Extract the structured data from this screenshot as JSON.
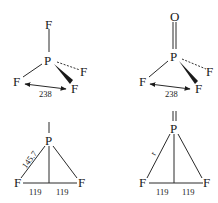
{
  "diagrams": [
    {
      "id": "pf3-3d",
      "atoms": {
        "central": "P",
        "top": "F",
        "dashed": "F",
        "left": "F",
        "wedge": "F"
      },
      "labels": {
        "ff_distance": "238"
      }
    },
    {
      "id": "opf3-3d",
      "atoms": {
        "central": "P",
        "top": "O",
        "dashed": "F",
        "left": "F",
        "wedge": "F"
      },
      "labels": {
        "ff_distance": "238"
      }
    },
    {
      "id": "pf3-projection",
      "atoms": {
        "central": "P",
        "left": "F",
        "right": "F"
      },
      "labels": {
        "pf_bond": "145.7",
        "half_left": "119",
        "half_right": "119"
      }
    },
    {
      "id": "opf3-projection",
      "atoms": {
        "central": "P",
        "left": "F",
        "right": "F"
      },
      "labels": {
        "pf_bond": "r",
        "half_left": "119",
        "half_right": "119"
      }
    }
  ]
}
